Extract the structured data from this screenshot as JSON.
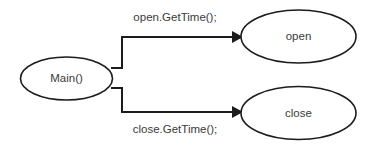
{
  "diagram": {
    "type": "flow-diagram",
    "background_color": "#ffffff",
    "stroke_color": "#1c1c1c",
    "text_color": "#3a3a3a",
    "width": 374,
    "height": 145,
    "nodes": [
      {
        "id": "main",
        "label": "Main()",
        "shape": "ellipse",
        "cx": 66.5,
        "cy": 78.5,
        "rx": 46,
        "ry": 21.5
      },
      {
        "id": "open",
        "label": "open",
        "shape": "ellipse",
        "cx": 298.5,
        "cy": 36.5,
        "rx": 57.5,
        "ry": 26.5
      },
      {
        "id": "close",
        "label": "close",
        "shape": "ellipse",
        "cx": 298.5,
        "cy": 113,
        "rx": 57.5,
        "ry": 26.5
      }
    ],
    "edges": [
      {
        "id": "edge-open",
        "from": "main",
        "to": "open",
        "label": "open.GetTime();",
        "label_x": 175,
        "label_y": 18,
        "path": "M 111 68 L 122 68 L 122 37 L 232 37",
        "arrow_points": "232,31 243,37 232,43"
      },
      {
        "id": "edge-close",
        "from": "main",
        "to": "close",
        "label": "close.GetTime();",
        "label_x": 175,
        "label_y": 130,
        "path": "M 111 88 L 122 88 L 122 112 L 232 112",
        "arrow_points": "232,106 243,112 232,118"
      }
    ]
  }
}
